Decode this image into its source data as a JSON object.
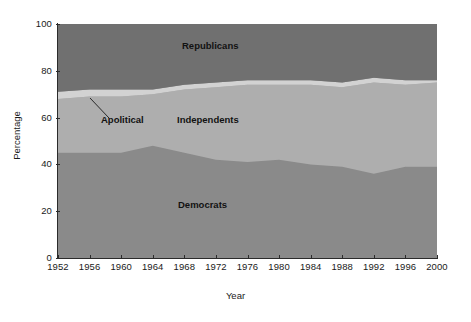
{
  "chart_data": {
    "type": "area",
    "stacked": true,
    "title": "",
    "xlabel": "Year",
    "ylabel": "Percentage",
    "xlim": [
      1952,
      2000
    ],
    "ylim": [
      0,
      100
    ],
    "grid": false,
    "legend_position": "in-plot-annotations",
    "x": [
      1952,
      1956,
      1960,
      1964,
      1968,
      1972,
      1976,
      1980,
      1984,
      1988,
      1992,
      1996,
      2000
    ],
    "xticks": [
      "1952",
      "1956",
      "1960",
      "1964",
      "1968",
      "1972",
      "1976",
      "1980",
      "1984",
      "1988",
      "1992",
      "1996",
      "2000"
    ],
    "yticks": [
      "0",
      "20",
      "40",
      "60",
      "80",
      "100"
    ],
    "series": [
      {
        "name": "Democrats",
        "color": "#8a8a8a",
        "order": 1,
        "values": [
          45,
          45,
          45,
          48,
          45,
          42,
          41,
          42,
          40,
          39,
          36,
          39,
          39
        ]
      },
      {
        "name": "Independents",
        "color": "#aeaeae",
        "order": 2,
        "values": [
          23,
          24,
          24,
          22,
          27,
          31,
          33,
          32,
          34,
          34,
          39,
          35,
          36
        ]
      },
      {
        "name": "Apolitical",
        "color": "#d2d2d2",
        "order": 3,
        "values": [
          3,
          3,
          3,
          2,
          2,
          2,
          2,
          2,
          2,
          2,
          2,
          2,
          1
        ]
      },
      {
        "name": "Republicans",
        "color": "#707070",
        "order": 4,
        "values": [
          29,
          28,
          28,
          28,
          26,
          25,
          24,
          24,
          24,
          25,
          23,
          24,
          24
        ]
      }
    ],
    "annotations": [
      {
        "text": "Republicans",
        "x": 1972,
        "y": 88
      },
      {
        "text": "Independents",
        "x": 1972,
        "y": 57
      },
      {
        "text": "Democrats",
        "x": 1972,
        "y": 22
      },
      {
        "text": "Apolitical",
        "x": 1962,
        "y": 57,
        "leader_line": true
      }
    ]
  },
  "axes": {
    "y_title": "Percentage",
    "x_title": "Year",
    "y_ticks": [
      {
        "label": "100",
        "value": 100
      },
      {
        "label": "80",
        "value": 80
      },
      {
        "label": "60",
        "value": 60
      },
      {
        "label": "40",
        "value": 40
      },
      {
        "label": "20",
        "value": 20
      },
      {
        "label": "0",
        "value": 0
      }
    ],
    "x_ticks": [
      {
        "label": "1952"
      },
      {
        "label": "1956"
      },
      {
        "label": "1960"
      },
      {
        "label": "1964"
      },
      {
        "label": "1968"
      },
      {
        "label": "1972"
      },
      {
        "label": "1976"
      },
      {
        "label": "1980"
      },
      {
        "label": "1984"
      },
      {
        "label": "1988"
      },
      {
        "label": "1992"
      },
      {
        "label": "1996"
      },
      {
        "label": "2000"
      }
    ]
  },
  "labels": {
    "republicans": "Republicans",
    "independents": "Independents",
    "democrats": "Democrats",
    "apolitical": "Apolitical"
  },
  "colors": {
    "republicans": "#707070",
    "apolitical": "#d2d2d2",
    "independents": "#aeaeae",
    "democrats": "#8a8a8a",
    "axis": "#2b2b2b",
    "text": "#1a1a1a",
    "background": "#ffffff"
  }
}
